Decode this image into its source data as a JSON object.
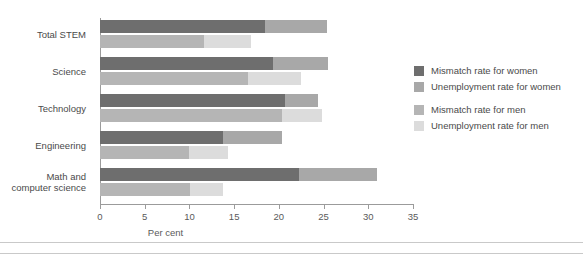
{
  "chart_data": {
    "type": "bar",
    "orientation": "horizontal",
    "stacked": true,
    "title": "",
    "xlabel": "Per cent",
    "ylabel": "",
    "xlim": [
      0,
      35
    ],
    "xticks": [
      0,
      5,
      10,
      15,
      20,
      25,
      30,
      35
    ],
    "xtick_labels": [
      "0",
      "5",
      "10",
      "15",
      "20",
      "25",
      "30",
      "35"
    ],
    "grid": false,
    "legend_position": "right",
    "categories": [
      "Total STEM",
      "Science",
      "Technology",
      "Engineering",
      "Math and computer science"
    ],
    "category_lines": [
      [
        "Total STEM"
      ],
      [
        "Science"
      ],
      [
        "Technology"
      ],
      [
        "Engineering"
      ],
      [
        "Math and",
        "computer science"
      ]
    ],
    "series": [
      {
        "name": "Mismatch rate for women",
        "group": "women",
        "color": "#6e6e6e",
        "values": [
          18.4,
          19.3,
          20.7,
          13.7,
          22.2
        ]
      },
      {
        "name": "Unemployment rate for women",
        "group": "women",
        "color": "#a8a8a8",
        "values": [
          7.0,
          6.2,
          3.7,
          6.7,
          8.8
        ]
      },
      {
        "name": "Mismatch rate for men",
        "group": "men",
        "color": "#b5b5b5",
        "values": [
          11.6,
          16.6,
          20.3,
          10.0,
          10.1
        ]
      },
      {
        "name": "Unemployment rate for men",
        "group": "men",
        "color": "#dcdcdc",
        "values": [
          5.3,
          5.9,
          4.5,
          4.3,
          3.6
        ]
      }
    ],
    "women_totals": [
      25.4,
      25.5,
      24.4,
      20.4,
      31.0
    ],
    "men_totals": [
      16.9,
      22.5,
      24.8,
      14.3,
      13.7
    ]
  },
  "legend": {
    "items": [
      {
        "label": "Mismatch rate for women",
        "color": "#6e6e6e"
      },
      {
        "label": "Unemployment rate for women",
        "color": "#a8a8a8"
      },
      {
        "label": "Mismatch rate for men",
        "color": "#b5b5b5"
      },
      {
        "label": "Unemployment rate for men",
        "color": "#dcdcdc"
      }
    ]
  },
  "axis": {
    "x_title": "Per cent"
  }
}
